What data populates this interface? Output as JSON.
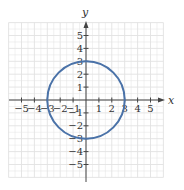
{
  "chart_data": {
    "type": "line",
    "title": "",
    "xlabel": "x",
    "ylabel": "y",
    "xlim": [
      -6,
      6
    ],
    "ylim": [
      -6,
      6
    ],
    "grid": true,
    "x_ticks": [
      -5,
      -4,
      -3,
      -2,
      -1,
      1,
      2,
      3,
      4,
      5
    ],
    "y_ticks": [
      5,
      4,
      3,
      2,
      1,
      -1,
      -2,
      -3,
      -4,
      -5
    ],
    "series": [
      {
        "name": "circle",
        "shape": "circle",
        "center": [
          0,
          0
        ],
        "radius": 3,
        "equation": "x^2 + y^2 = 9",
        "color": "#4a72a8"
      }
    ]
  },
  "labels": {
    "x_axis": "x",
    "y_axis": "y",
    "x_ticks": [
      "−5",
      "−4",
      "−3",
      "−2",
      "−1",
      "1",
      "2",
      "3",
      "4",
      "5"
    ],
    "y_ticks": [
      "5",
      "4",
      "3",
      "2",
      "1",
      "−1",
      "−2",
      "−3",
      "−4",
      "−5"
    ]
  },
  "colors": {
    "curve": "#4a72a8",
    "grid": "#e2e2e2",
    "axis": "#444444"
  }
}
